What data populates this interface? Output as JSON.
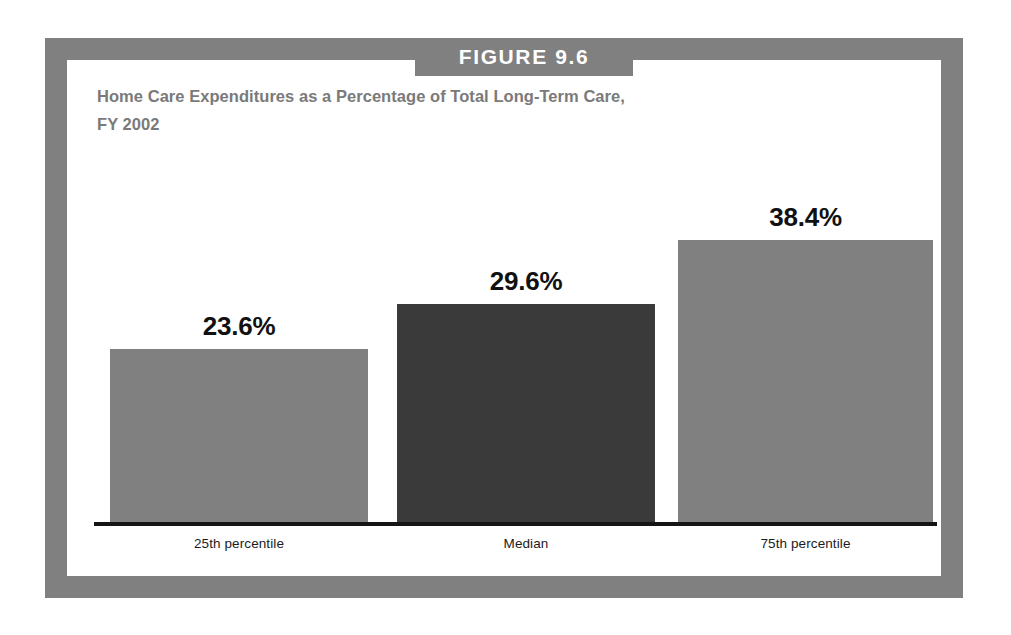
{
  "figure": {
    "banner_label": "FIGURE 9.6",
    "title_line_1": "Home Care Expenditures as a Percentage of Total Long-Term Care,",
    "title_line_2": "FY 2002"
  },
  "colors": {
    "frame_gray": "#808080",
    "banner_gray": "#808080",
    "title_gray": "#7a7a7a",
    "bar_light_gray": "#808080",
    "bar_dark_gray": "#3a3a3a",
    "axis_black": "#151515",
    "panel_white": "#ffffff"
  },
  "chart_data": {
    "type": "bar",
    "title": "Home Care Expenditures as a Percentage of Total Long-Term Care, FY 2002",
    "xlabel": "",
    "ylabel": "",
    "ylim": [
      0,
      48
    ],
    "grid": false,
    "legend": "none",
    "categories": [
      "25th percentile",
      "Median",
      "75th percentile"
    ],
    "values": [
      23.6,
      29.6,
      38.4
    ],
    "value_labels": [
      "23.6%",
      "29.6%",
      "38.4%"
    ],
    "bar_colors": [
      "#808080",
      "#3a3a3a",
      "#808080"
    ]
  }
}
